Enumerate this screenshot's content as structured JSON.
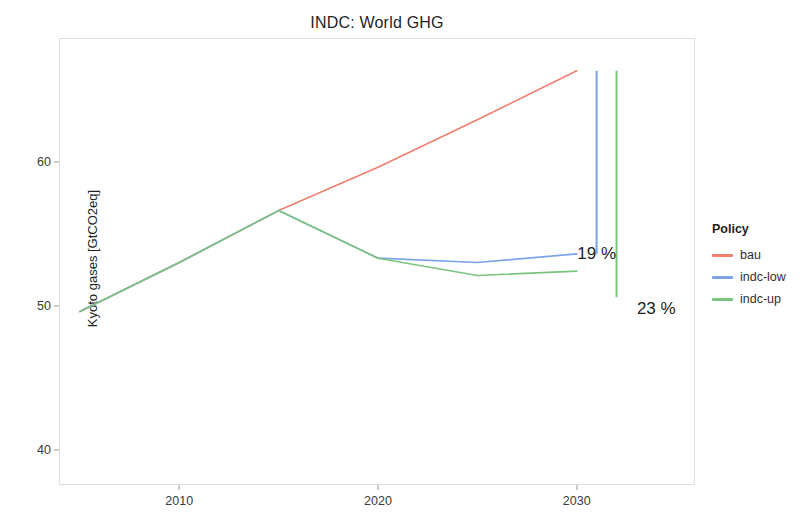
{
  "chart_data": {
    "type": "line",
    "title": "INDC: World GHG",
    "xlabel": "",
    "ylabel": "Kyoto gases [GtCO2eq]",
    "xlim": [
      2004,
      2036
    ],
    "ylim": [
      37.5,
      68.5
    ],
    "xticks": [
      "2010",
      "2020",
      "2030"
    ],
    "xtick_values": [
      2010,
      2020,
      2030
    ],
    "yticks": [
      "40",
      "50",
      "60"
    ],
    "ytick_values": [
      40,
      50,
      60
    ],
    "grid": false,
    "legend_position": "right",
    "legend_title": "Policy",
    "series": [
      {
        "name": "bau",
        "color": "#F07F6E",
        "x": [
          2005,
          2010,
          2015,
          2020,
          2025,
          2030
        ],
        "values": [
          49.6,
          53.0,
          56.6,
          59.6,
          62.9,
          66.3
        ]
      },
      {
        "name": "indc-low",
        "color": "#7BA3E8",
        "x": [
          2005,
          2010,
          2015,
          2020,
          2025,
          2030
        ],
        "values": [
          49.6,
          53.0,
          56.6,
          53.3,
          53.0,
          53.6
        ]
      },
      {
        "name": "indc-up",
        "color": "#7BC47F",
        "x": [
          2005,
          2010,
          2015,
          2020,
          2025,
          2030
        ],
        "values": [
          49.6,
          53.0,
          56.6,
          53.3,
          52.1,
          52.4
        ]
      }
    ],
    "range_bars": [
      {
        "name": "indc-low-range",
        "color": "#7BA3E8",
        "x": 2031,
        "y_low": 53.6,
        "y_high": 66.3
      },
      {
        "name": "indc-up-range",
        "color": "#7BC47F",
        "x": 2032,
        "y_low": 50.6,
        "y_high": 66.3
      }
    ],
    "annotations": [
      {
        "text": "19 %",
        "x": 2031,
        "y": 53.6
      },
      {
        "text": "23 %",
        "x": 2034,
        "y": 49.8
      }
    ]
  },
  "legend": {
    "title": "Policy",
    "items": [
      {
        "label": "bau",
        "color": "#F07F6E"
      },
      {
        "label": "indc-low",
        "color": "#7BA3E8"
      },
      {
        "label": "indc-up",
        "color": "#7BC47F"
      }
    ]
  }
}
